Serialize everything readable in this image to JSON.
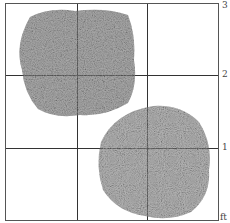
{
  "figure": {
    "scale_labels": [
      "3",
      "2",
      "1",
      "ft"
    ],
    "unit": "ft",
    "colors": {
      "foliage_dark": "#3a3a3a",
      "foliage_mid": "#6a6a6a",
      "foliage_light": "#9a9a9a",
      "grid": "#333333",
      "background": "#ffffff"
    },
    "shrubs": [
      {
        "name": "shrub-upper-left",
        "shape": "square-ish mound"
      },
      {
        "name": "shrub-lower-right",
        "shape": "round mound"
      }
    ]
  }
}
